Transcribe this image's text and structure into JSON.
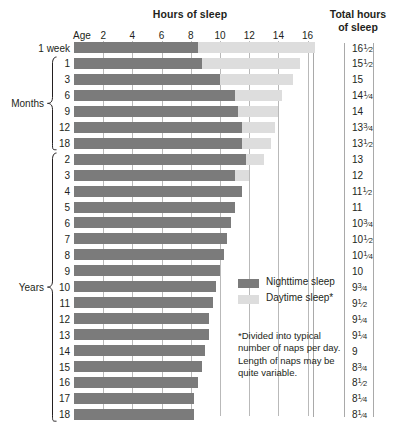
{
  "header": {
    "hours_title": "Hours of sleep",
    "total_title_line1": "Total hours",
    "total_title_line2": "of sleep",
    "age_label": "Age"
  },
  "axis": {
    "ticks": [
      2,
      4,
      6,
      8,
      10,
      12,
      14,
      16
    ],
    "tick_labels": [
      "2",
      "4",
      "6",
      "8",
      "10",
      "12",
      "14",
      "16"
    ],
    "min": 0,
    "max": 17.2,
    "unit": "hours"
  },
  "groups": [
    {
      "label": "Months",
      "first_row": 1,
      "last_row": 6
    },
    {
      "label": "Years",
      "first_row": 7,
      "last_row": 23
    }
  ],
  "legend": {
    "items": [
      {
        "name": "nighttime-sleep",
        "label": "Nighttime sleep",
        "color": "#7b7b7b"
      },
      {
        "name": "daytime-sleep",
        "label": "Daytime sleep*",
        "color": "#dddddd"
      }
    ]
  },
  "footnote": "*Divided into typical number of naps per day. Length of naps may be quite variable.",
  "chart_data": {
    "type": "bar",
    "title": "Hours of sleep",
    "xlabel": "Hours of sleep",
    "ylabel": "Age",
    "xlim": [
      0,
      17.2
    ],
    "grid": true,
    "orientation": "horizontal",
    "stacked": true,
    "legend_position": "inside-right",
    "categories": [
      "1 week",
      "1",
      "3",
      "6",
      "9",
      "12",
      "18",
      "2",
      "3",
      "4",
      "5",
      "6",
      "7",
      "8",
      "9",
      "10",
      "11",
      "12",
      "13",
      "14",
      "15",
      "16",
      "17",
      "18"
    ],
    "category_units": [
      "week",
      "months",
      "months",
      "months",
      "months",
      "months",
      "months",
      "years",
      "years",
      "years",
      "years",
      "years",
      "years",
      "years",
      "years",
      "years",
      "years",
      "years",
      "years",
      "years",
      "years",
      "years",
      "years",
      "years"
    ],
    "series": [
      {
        "name": "Nighttime sleep",
        "color": "#7b7b7b",
        "values": [
          8.5,
          8.75,
          10,
          11,
          11.25,
          11.5,
          11.5,
          11.75,
          11,
          11,
          11,
          10.75,
          10.5,
          10.25,
          10,
          9.75,
          9.5,
          9.25,
          9.25,
          9,
          8.75,
          8.5,
          8.25,
          8.25
        ]
      },
      {
        "name": "Daytime sleep*",
        "color": "#dddddd",
        "values": [
          8,
          6.75,
          5,
          3.25,
          2.75,
          2.25,
          2,
          1.25,
          1,
          0,
          0,
          0,
          0,
          0,
          0,
          0,
          0,
          0,
          0,
          0,
          0,
          0,
          0,
          0
        ]
      }
    ],
    "totals": [
      16.5,
      15.5,
      15,
      14.25,
      14,
      13.75,
      13.5,
      13,
      12,
      11.5,
      11,
      10.75,
      10.5,
      10.25,
      10,
      9.75,
      9.5,
      9.25,
      9.25,
      9,
      8.75,
      8.5,
      8.25,
      8.25
    ],
    "total_labels": [
      "16 1/2",
      "15 1/2",
      "15",
      "14 1/4",
      "14",
      "13 3/4",
      "13 1/2",
      "13",
      "12",
      "11 1/2",
      "11",
      "10 3/4",
      "10 1/2",
      "10 1/4",
      "10",
      "9 3/4",
      "9 1/2",
      "9 1/4",
      "9 1/4",
      "9",
      "8 3/4",
      "8 1/2",
      "8 1/4",
      "8 1/4"
    ]
  },
  "rows": [
    {
      "label": "1 week",
      "night": 8.5,
      "day": 8.0,
      "total_whole": "16",
      "total_num": "1",
      "total_den": "2"
    },
    {
      "label": "1",
      "night": 8.75,
      "day": 6.75,
      "total_whole": "15",
      "total_num": "1",
      "total_den": "2"
    },
    {
      "label": "3",
      "night": 10,
      "day": 5.0,
      "total_whole": "15",
      "total_num": "",
      "total_den": ""
    },
    {
      "label": "6",
      "night": 11,
      "day": 3.25,
      "total_whole": "14",
      "total_num": "1",
      "total_den": "4"
    },
    {
      "label": "9",
      "night": 11.25,
      "day": 2.75,
      "total_whole": "14",
      "total_num": "",
      "total_den": ""
    },
    {
      "label": "12",
      "night": 11.5,
      "day": 2.25,
      "total_whole": "13",
      "total_num": "3",
      "total_den": "4"
    },
    {
      "label": "18",
      "night": 11.5,
      "day": 2.0,
      "total_whole": "13",
      "total_num": "1",
      "total_den": "2"
    },
    {
      "label": "2",
      "night": 11.75,
      "day": 1.25,
      "total_whole": "13",
      "total_num": "",
      "total_den": ""
    },
    {
      "label": "3",
      "night": 11,
      "day": 1.0,
      "total_whole": "12",
      "total_num": "",
      "total_den": ""
    },
    {
      "label": "4",
      "night": 11.5,
      "day": 0,
      "total_whole": "11",
      "total_num": "1",
      "total_den": "2"
    },
    {
      "label": "5",
      "night": 11,
      "day": 0,
      "total_whole": "11",
      "total_num": "",
      "total_den": ""
    },
    {
      "label": "6",
      "night": 10.75,
      "day": 0,
      "total_whole": "10",
      "total_num": "3",
      "total_den": "4"
    },
    {
      "label": "7",
      "night": 10.5,
      "day": 0,
      "total_whole": "10",
      "total_num": "1",
      "total_den": "2"
    },
    {
      "label": "8",
      "night": 10.25,
      "day": 0,
      "total_whole": "10",
      "total_num": "1",
      "total_den": "4"
    },
    {
      "label": "9",
      "night": 10,
      "day": 0,
      "total_whole": "10",
      "total_num": "",
      "total_den": ""
    },
    {
      "label": "10",
      "night": 9.75,
      "day": 0,
      "total_whole": "9",
      "total_num": "3",
      "total_den": "4"
    },
    {
      "label": "11",
      "night": 9.5,
      "day": 0,
      "total_whole": "9",
      "total_num": "1",
      "total_den": "2"
    },
    {
      "label": "12",
      "night": 9.25,
      "day": 0,
      "total_whole": "9",
      "total_num": "1",
      "total_den": "4"
    },
    {
      "label": "13",
      "night": 9.25,
      "day": 0,
      "total_whole": "9",
      "total_num": "1",
      "total_den": "4"
    },
    {
      "label": "14",
      "night": 9,
      "day": 0,
      "total_whole": "9",
      "total_num": "",
      "total_den": ""
    },
    {
      "label": "15",
      "night": 8.75,
      "day": 0,
      "total_whole": "8",
      "total_num": "3",
      "total_den": "4"
    },
    {
      "label": "16",
      "night": 8.5,
      "day": 0,
      "total_whole": "8",
      "total_num": "1",
      "total_den": "2"
    },
    {
      "label": "17",
      "night": 8.25,
      "day": 0,
      "total_whole": "8",
      "total_num": "1",
      "total_den": "4"
    },
    {
      "label": "18",
      "night": 8.25,
      "day": 0,
      "total_whole": "8",
      "total_num": "1",
      "total_den": "4"
    }
  ],
  "layout": {
    "x_origin": 74,
    "px_per_hour": 14.6,
    "row_top": 42,
    "row_pitch": 15.95,
    "bar_height": 11,
    "total_x": 352,
    "label_right": 70,
    "sep_x": [
      313,
      344,
      373
    ]
  }
}
